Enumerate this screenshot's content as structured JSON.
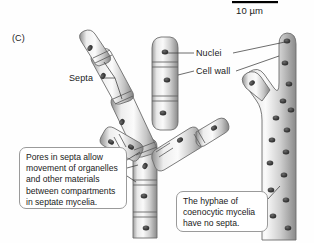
{
  "figure": {
    "panel_label": "(C)",
    "scale_bar": {
      "label": "10 µm",
      "bar_color": "#000000"
    }
  },
  "labels": {
    "nuclei": "Nuclei",
    "cell_wall": "Cell wall",
    "septa": "Septa"
  },
  "callouts": {
    "septate": "Pores in septa allow movement of organelles and other materials between compartments in septate mycelia.",
    "coenocytic": "The hyphae of coenocytic mycelia have no septa."
  },
  "colors": {
    "background": "#fefefe",
    "hypha_light": "#f2f2f2",
    "hypha_mid": "#c9c9c9",
    "hypha_dark": "#8e8e8e",
    "hypha_outline": "#6d6d6d",
    "nucleus": "#3a3a3a",
    "leader_line": "#3c3c3c",
    "callout_border": "#9a9a9a",
    "text": "#1a1a1a"
  }
}
